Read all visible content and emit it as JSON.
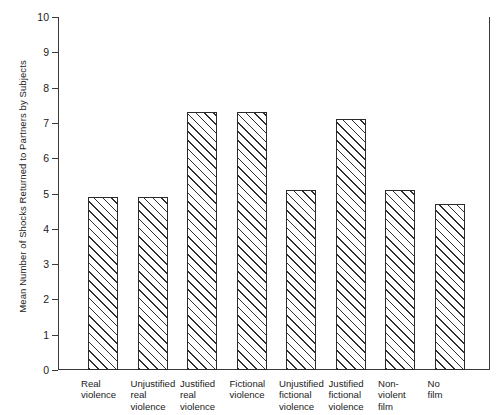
{
  "chart_data": {
    "type": "bar",
    "title": "",
    "xlabel": "",
    "ylabel": "Mean Number of Shocks Returned to Partners by Subjects",
    "ylim": [
      0,
      10
    ],
    "ytick_step": 1,
    "grid": false,
    "legend": "none",
    "orientation": "vertical",
    "bar_fill": "diagonal-hatch",
    "categories": [
      "Real\nviolence",
      "Unjustified\nreal\nviolence",
      "Justified\nreal\nviolence",
      "Fictional\nviolence",
      "Unjustified\nfictional\nviolence",
      "Justified\nfictional\nviolence",
      "Non-\nviolent\nfilm",
      "No\nfilm"
    ],
    "values": [
      4.9,
      4.9,
      7.3,
      7.3,
      5.1,
      7.1,
      5.1,
      4.7
    ],
    "ytick_labels": [
      "0",
      "1",
      "2",
      "3",
      "4",
      "5",
      "6",
      "7",
      "8",
      "9",
      "10"
    ]
  },
  "colors": {
    "axis": "#3a3a3a",
    "bar_outline": "#2b2b2b",
    "hatch": "#2f2f2f",
    "background": "#ffffff",
    "text": "#222222"
  }
}
